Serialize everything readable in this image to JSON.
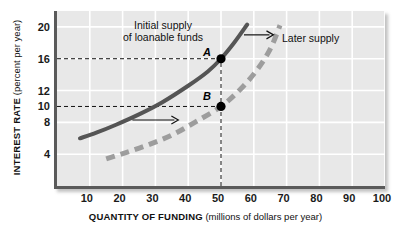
{
  "axes": {
    "ylabel_bold": "INTEREST RATE",
    "ylabel_light": " (percent per year)",
    "xlabel_bold": "QUANTITY OF FUNDING",
    "xlabel_light": " (millions of dollars per year)"
  },
  "annotations": {
    "initial_line1": "Initial supply",
    "initial_line2": "of loanable funds",
    "later": "Later supply",
    "point_a": "A",
    "point_b": "B"
  },
  "colors": {
    "panel": "#e8e8e8",
    "gridline": "#ffffff",
    "axis": "#5a5a5a",
    "initial_curve": "#555555",
    "later_curve": "#9d9d9d",
    "guide": "#111111",
    "point": "#000000"
  },
  "chart_data": {
    "type": "line",
    "title": "",
    "xlabel": "QUANTITY OF FUNDING (millions of dollars per year)",
    "ylabel": "INTEREST RATE (percent per year)",
    "xlim": [
      0,
      100
    ],
    "ylim": [
      0,
      22
    ],
    "xticks": [
      10,
      20,
      30,
      40,
      50,
      60,
      70,
      80,
      90,
      100
    ],
    "yticks": [
      4,
      8,
      10,
      12,
      16,
      20
    ],
    "grid": true,
    "gridlines_x": [
      10,
      20,
      30,
      40,
      50,
      60,
      70,
      80,
      90,
      100
    ],
    "gridlines_y": [
      4,
      8,
      12,
      16,
      20
    ],
    "legend_position": "in-plot annotations",
    "series": [
      {
        "name": "Initial supply of loanable funds",
        "style": "solid",
        "color": "#555555",
        "x": [
          7,
          12,
          18,
          25,
          32,
          40,
          46,
          50,
          54,
          58
        ],
        "y": [
          6.0,
          6.7,
          7.7,
          9.0,
          10.5,
          12.6,
          14.4,
          16.0,
          18.0,
          20.3
        ]
      },
      {
        "name": "Later supply",
        "style": "dashed",
        "color": "#9d9d9d",
        "x": [
          15,
          21,
          28,
          35,
          42,
          50,
          56,
          61,
          65,
          68
        ],
        "y": [
          3.4,
          4.2,
          5.2,
          6.4,
          8.0,
          10.0,
          12.2,
          14.6,
          17.2,
          20.2
        ]
      }
    ],
    "points": [
      {
        "label": "A",
        "x": 50,
        "y": 16
      },
      {
        "label": "B",
        "x": 50,
        "y": 10
      }
    ],
    "guides": [
      {
        "type": "horizontal",
        "y": 16,
        "from_x": 0,
        "to_x": 50
      },
      {
        "type": "horizontal",
        "y": 10,
        "from_x": 0,
        "to_x": 50
      },
      {
        "type": "vertical",
        "x": 50,
        "from_y": 0,
        "to_y": 16
      }
    ],
    "arrows": [
      {
        "name": "shift-arrow-lower",
        "from": [
          23,
          8.3
        ],
        "to": [
          37,
          8.3
        ]
      },
      {
        "name": "shift-arrow-upper",
        "from": [
          57,
          19.0
        ],
        "to": [
          66,
          19.0
        ]
      }
    ]
  }
}
